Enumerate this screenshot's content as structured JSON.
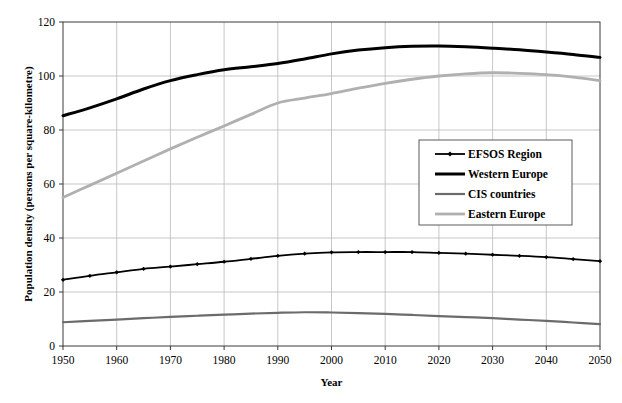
{
  "chart_data": {
    "type": "line",
    "title": "",
    "xlabel": "Year",
    "ylabel": "Population density (persons per square-kilometre)",
    "xlim": [
      1950,
      2050
    ],
    "ylim": [
      0,
      120
    ],
    "yticks": [
      0,
      20,
      40,
      60,
      80,
      100,
      120
    ],
    "xticks": [
      1950,
      1960,
      1970,
      1980,
      1990,
      2000,
      2010,
      2020,
      2030,
      2040,
      2050
    ],
    "grid": true,
    "legend_position": "center-right",
    "x": [
      1950,
      1955,
      1960,
      1965,
      1970,
      1975,
      1980,
      1985,
      1990,
      1995,
      2000,
      2005,
      2010,
      2015,
      2020,
      2025,
      2030,
      2035,
      2040,
      2045,
      2050
    ],
    "series": [
      {
        "name": "EFSOS Region",
        "color": "#000000",
        "width": 1.8,
        "marker": "diamond",
        "values": [
          24.5,
          26.0,
          27.3,
          28.6,
          29.4,
          30.3,
          31.2,
          32.3,
          33.4,
          34.2,
          34.7,
          34.8,
          34.8,
          34.8,
          34.5,
          34.2,
          33.8,
          33.4,
          32.9,
          32.2,
          31.4
        ]
      },
      {
        "name": "Western Europe",
        "color": "#000000",
        "width": 3.0,
        "marker": "none",
        "values": [
          85.3,
          88.2,
          91.5,
          95.2,
          98.3,
          100.5,
          102.3,
          103.4,
          104.6,
          106.3,
          108.2,
          109.6,
          110.5,
          111.0,
          111.1,
          110.8,
          110.3,
          109.7,
          108.9,
          108.0,
          106.9
        ]
      },
      {
        "name": "CIS countries",
        "color": "#6b6b6b",
        "width": 2.2,
        "marker": "none",
        "values": [
          8.8,
          9.3,
          9.8,
          10.3,
          10.8,
          11.2,
          11.6,
          12.0,
          12.3,
          12.5,
          12.4,
          12.2,
          11.9,
          11.5,
          11.1,
          10.7,
          10.3,
          9.8,
          9.3,
          8.7,
          8.1
        ]
      },
      {
        "name": "Eastern Europe",
        "color": "#b0b0b0",
        "width": 2.8,
        "marker": "none",
        "values": [
          55.0,
          59.5,
          64.0,
          68.5,
          73.0,
          77.3,
          81.5,
          85.8,
          90.0,
          91.8,
          93.5,
          95.5,
          97.3,
          98.8,
          100.0,
          100.8,
          101.2,
          101.0,
          100.5,
          99.6,
          98.3
        ]
      }
    ]
  }
}
